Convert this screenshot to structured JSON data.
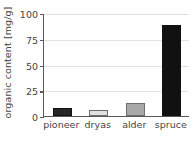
{
  "chart_data": {
    "type": "bar",
    "title": "",
    "subtitle": "",
    "xlabel": "",
    "ylabel": "organic content [mg/g]",
    "categories": [
      "pioneer",
      "dryas",
      "alder",
      "spruce"
    ],
    "values": [
      8,
      6,
      13,
      88
    ],
    "series": [
      {
        "name": "organic content",
        "values": [
          8,
          6,
          13,
          88
        ]
      }
    ],
    "bar_colors": [
      "#262626",
      "#e0e0e0",
      "#a8a8a8",
      "#111111"
    ],
    "bar_edge_colors": [
      "#111111",
      "#6e6e6e",
      "#6e6e6e",
      "#111111"
    ],
    "ylim": [
      0,
      100
    ],
    "yticks": [
      0,
      25,
      50,
      75,
      100
    ],
    "ytick_labels": [
      "0",
      "25",
      "50",
      "75",
      "100"
    ],
    "xlim": [
      0,
      4
    ],
    "grid": true,
    "grid_axis": "y",
    "grid_color": "#e2e2e2",
    "legend": false,
    "legend_position": "none",
    "axis_color": "#5a5a5a",
    "text_color": "#444444",
    "background_color": "#ffffff",
    "annotations": []
  }
}
